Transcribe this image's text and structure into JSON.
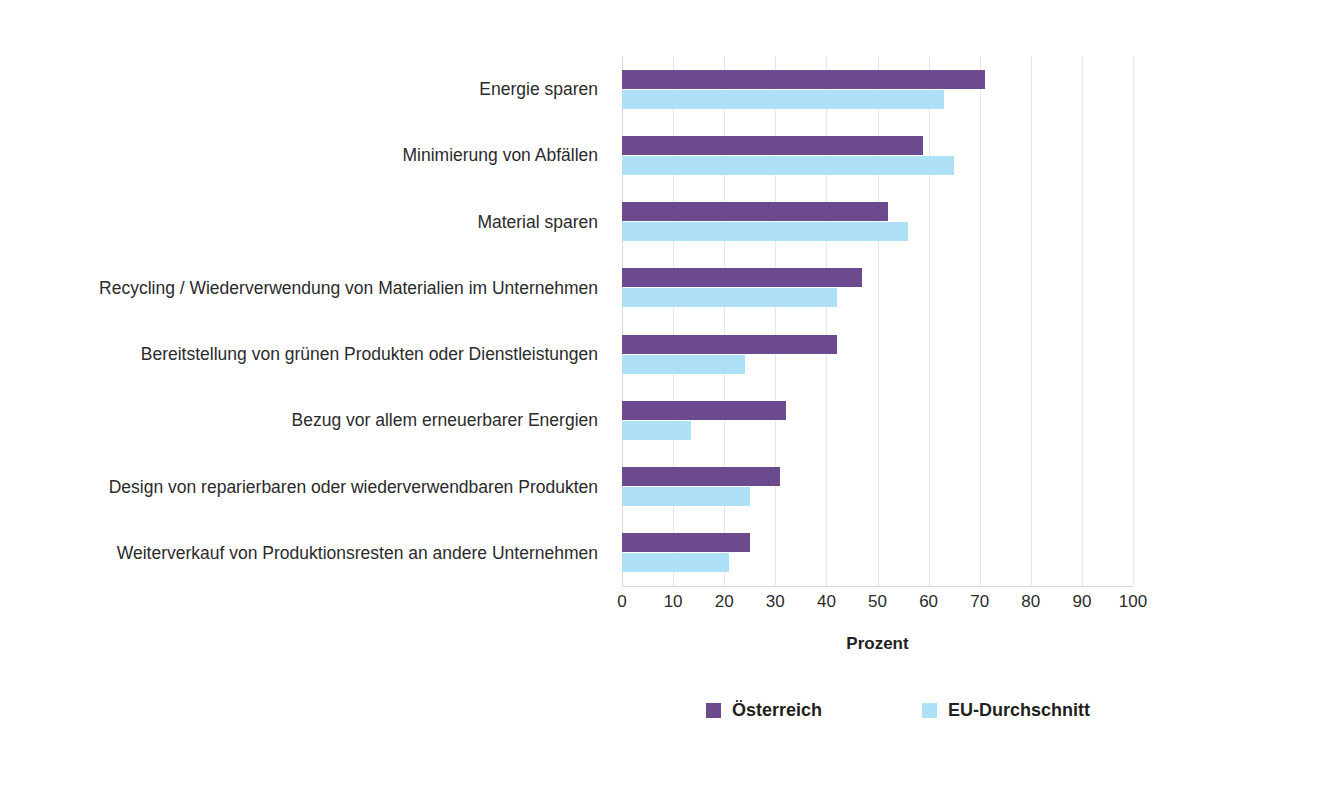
{
  "chart_data": {
    "type": "bar",
    "orientation": "horizontal",
    "title": "",
    "xlabel": "Prozent",
    "ylabel": "",
    "xlim": [
      0,
      100
    ],
    "xticks": [
      0,
      10,
      20,
      30,
      40,
      50,
      60,
      70,
      80,
      90,
      100
    ],
    "xticklabels": [
      "0",
      "10",
      "20",
      "30",
      "40",
      "50",
      "60",
      "70",
      "80",
      "90",
      "100"
    ],
    "grid": "vertical",
    "legend_position": "bottom",
    "categories": [
      "Energie sparen",
      "Minimierung von Abfällen",
      "Material sparen",
      "Recycling / Wiederverwendung von Materialien im Unternehmen",
      "Bereitstellung von grünen Produkten oder Dienstleistungen",
      "Bezug vor allem erneuerbarer Energien",
      "Design von reparierbaren oder wiederverwendbaren Produkten",
      "Weiterverkauf von Produktionsresten an andere Unternehmen"
    ],
    "series": [
      {
        "name": "Österreich",
        "color": "#6b4a8e",
        "values": [
          71,
          59,
          52,
          47,
          42,
          32,
          31,
          25
        ]
      },
      {
        "name": "EU-Durchschnitt",
        "color": "#aee0f7",
        "values": [
          63,
          65,
          56,
          42,
          24,
          13.5,
          25,
          21
        ]
      }
    ]
  },
  "legend": {
    "items": [
      {
        "label": "Österreich",
        "color": "#6b4a8e"
      },
      {
        "label": "EU-Durchschnitt",
        "color": "#aee0f7"
      }
    ]
  },
  "axis": {
    "x_title": "Prozent"
  },
  "colors": {
    "series_austria": "#6b4a8e",
    "series_eu": "#aee0f7",
    "gridline": "#e8e6ea",
    "text": "#231f20"
  }
}
